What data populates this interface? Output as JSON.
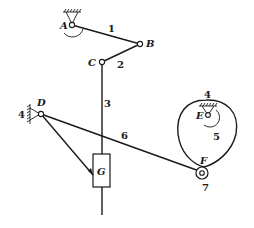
{
  "diagram": {
    "type": "linkage-mechanism",
    "joints": {
      "A": {
        "label": "A",
        "x": 72,
        "y": 25
      },
      "B": {
        "label": "B",
        "x": 140,
        "y": 44
      },
      "C": {
        "label": "C",
        "x": 102,
        "y": 62
      },
      "D": {
        "label": "D",
        "x": 41,
        "y": 114
      },
      "E": {
        "label": "E",
        "x": 208,
        "y": 116
      },
      "F": {
        "label": "F",
        "x": 202,
        "y": 172
      },
      "G": {
        "label": "G",
        "x": 101,
        "y": 171
      }
    },
    "links": {
      "l1": "1",
      "l2": "2",
      "l3": "3",
      "l4_frame_cam": "4",
      "l4_frame_d": "4",
      "l5": "5",
      "l6": "6",
      "l7": "7"
    },
    "colors": {
      "ink": "#1a1a1a",
      "background": "#ffffff"
    }
  }
}
